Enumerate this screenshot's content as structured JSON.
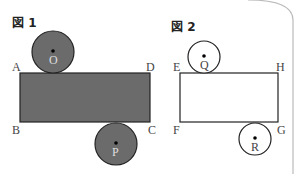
{
  "figure1": {
    "title": "図 1",
    "rect_labels": {
      "tl": "A",
      "tr": "D",
      "bl": "B",
      "br": "C"
    },
    "circle_top": "O",
    "circle_bottom": "P",
    "fill": "#6b6b6b"
  },
  "figure2": {
    "title": "図 2",
    "rect_labels": {
      "tl": "E",
      "tr": "H",
      "bl": "F",
      "br": "G"
    },
    "circle_top": "Q",
    "circle_bottom": "R"
  }
}
